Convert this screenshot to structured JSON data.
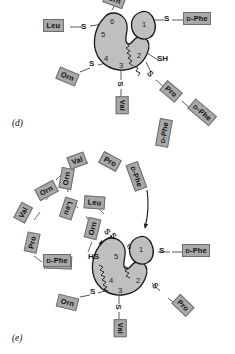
{
  "figure": {
    "colors": {
      "residue_fill": "#a8a8a8",
      "residue_stroke": "#6f6f6f",
      "enzyme_fill": "#bfbfbf",
      "enzyme_stroke": "#1a1a1a",
      "bond_line": "#4a4a4a",
      "text": "#101010",
      "background": "#ffffff"
    }
  },
  "panels": [
    {
      "id": "d",
      "label": "(d)",
      "caption_position": "bottom-left",
      "enzyme": {
        "name": "peptide-synthetase-multienzyme",
        "domain_numbers": [
          "1",
          "2",
          "3",
          "4",
          "5",
          "6"
        ],
        "separate_lobe_number": "1",
        "squiggle_linker": "phosphopantetheine-arm"
      },
      "tethers": [
        {
          "domain": "1",
          "atom": "S",
          "residue": "D-Phe",
          "small_caps_prefix": "D",
          "rotation": 0
        },
        {
          "domain": "2",
          "atom": "SH",
          "residue": null,
          "rotation": 0
        },
        {
          "domain": "2",
          "atom": "S",
          "residue": "Pro",
          "rotation": 40,
          "chain_next": {
            "atom": null,
            "residue": "D-Phe",
            "rotation": 40
          }
        },
        {
          "domain": "3",
          "atom": "S",
          "residue": "Val",
          "rotation": 90
        },
        {
          "domain": "4",
          "atom": "S",
          "residue": "Orn",
          "rotation": 22
        },
        {
          "domain": "5",
          "atom": "S",
          "residue": "Leu",
          "rotation": 0
        },
        {
          "domain": "6",
          "atom": null,
          "residue": "Orn",
          "rotation": 20,
          "clipped_at_top": true
        }
      ]
    },
    {
      "id": "e",
      "label": "(e)",
      "caption_position": "bottom-left",
      "enzyme": {
        "name": "peptide-synthetase-multienzyme",
        "domain_numbers": [
          "1",
          "2",
          "3",
          "4",
          "5",
          "6"
        ],
        "separate_lobe_number": "1",
        "squiggle_linker": "phosphopantetheine-arm"
      },
      "cyclic_peptide": {
        "name": "gramicidin-S-cyclodecapeptide",
        "residues": [
          {
            "label": "Val",
            "rotation": -30
          },
          {
            "label": "Pro",
            "rotation": 28
          },
          {
            "label": "D-Phe",
            "small_caps_prefix": "D",
            "rotation": 68
          },
          {
            "label": "Leu",
            "rotation": 4
          },
          {
            "label": "Orn",
            "rotation": -66
          },
          {
            "label": "Val",
            "rotation": -62
          },
          {
            "label": "Pro",
            "rotation": -78
          },
          {
            "label": "D-Phe",
            "small_caps_prefix": "D",
            "rotation": 2
          },
          {
            "label": "Leu",
            "rotation": 108
          },
          {
            "label": "Orn",
            "rotation": -32
          },
          {
            "label": "Orn",
            "rotation": -76
          }
        ],
        "release_arrow": "peptide-release-arrow"
      },
      "tethers": [
        {
          "domain": "1",
          "atom": "S",
          "residue": "D-Phe",
          "small_caps_prefix": "D",
          "rotation": 0
        },
        {
          "domain": "2",
          "atom": "S",
          "residue": "Pro",
          "rotation": 40
        },
        {
          "domain": "3",
          "atom": "S",
          "residue": "Val",
          "rotation": 90
        },
        {
          "domain": "4",
          "atom": "HS",
          "residue": null,
          "rotation": 0
        },
        {
          "domain": "4",
          "atom": "S",
          "residue": "Orn",
          "rotation": 14
        },
        {
          "domain": "5",
          "atom": "S",
          "residue": "Leu",
          "rotation": 104
        },
        {
          "domain": "6",
          "atom": "S",
          "residue": "D-Phe",
          "small_caps_prefix": "D",
          "rotation": 6
        }
      ]
    }
  ],
  "atoms": {
    "sulfur": "S",
    "thiol": "SH",
    "thiol_alt": "HS"
  },
  "panel_d": {
    "label": "(d)",
    "n1": "1",
    "n2": "2",
    "n3": "3",
    "n4": "4",
    "n5": "5",
    "n6": "6",
    "s1": "S",
    "sh2": "SH",
    "s2": "S",
    "s3": "S",
    "s4": "S",
    "s5": "S",
    "r_dphe_1_pre": "D",
    "r_dphe_1_post": "-Phe",
    "r_pro": "Pro",
    "r_dphe_2_pre": "D",
    "r_dphe_2_post": "-Phe",
    "r_val": "Val",
    "r_orn": "Orn",
    "r_leu": "Leu",
    "r_orn_top": "Orn"
  },
  "panel_e": {
    "label": "(e)",
    "n1": "1",
    "n2": "2",
    "n3": "3",
    "n4": "4",
    "n5": "5",
    "n6": "6",
    "s1": "S",
    "s2": "S",
    "s3": "S",
    "hs4": "HS",
    "s4": "S",
    "s5": "S",
    "s6": "S",
    "r_dphe_1_pre": "D",
    "r_dphe_1_post": "-Phe",
    "r_pro_b": "Pro",
    "r_val_b": "Val",
    "r_orn_b": "Orn",
    "r_leu_b": "Leu",
    "r_dphe_b_pre": "D",
    "r_dphe_b_post": "-Phe",
    "c_val_1": "Val",
    "c_pro_1": "Pro",
    "c_dphe_1_pre": "D",
    "c_dphe_1_post": "-Phe",
    "c_leu_1": "Leu",
    "c_orn_1": "Orn",
    "c_orn_2": "Orn",
    "c_orn_3": "Orn",
    "c_val_2": "Val",
    "c_pro_2": "Pro",
    "c_dphe_2_pre": "D",
    "c_dphe_2_post": "-Phe",
    "c_leu_2": "Leu",
    "c_dphe_top_pre": "D",
    "c_dphe_top_post": "-Phe"
  }
}
